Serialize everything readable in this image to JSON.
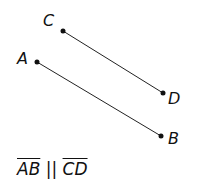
{
  "diagram": {
    "points": [
      {
        "label": "C",
        "x": 63,
        "y": 31,
        "lx": 43,
        "ly": 26
      },
      {
        "label": "D",
        "x": 163,
        "y": 93,
        "lx": 168,
        "ly": 104
      },
      {
        "label": "A",
        "x": 37,
        "y": 62,
        "lx": 17,
        "ly": 64
      },
      {
        "label": "B",
        "x": 161,
        "y": 136,
        "lx": 168,
        "ly": 144
      }
    ],
    "segments": [
      {
        "from": "C",
        "to": "D"
      },
      {
        "from": "A",
        "to": "B"
      }
    ],
    "caption": {
      "seg1": "AB",
      "relation": " || ",
      "seg2": "CD"
    }
  }
}
